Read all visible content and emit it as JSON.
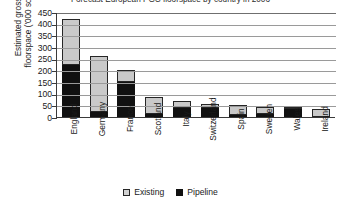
{
  "chart_data": {
    "type": "bar",
    "stacked": true,
    "title": "Forecast European PGC floorspace by country in 2006",
    "xlabel": "",
    "ylabel": "Estimated gross\nfloorspace ('000 sq.m)",
    "ylim": [
      0,
      450
    ],
    "ytick_values": [
      450,
      400,
      350,
      300,
      250,
      200,
      150,
      100,
      50,
      0
    ],
    "ytick_labels": [
      "450",
      "400",
      "350",
      "300",
      "250",
      "200",
      "150",
      "100",
      "50",
      "0"
    ],
    "grid": true,
    "legend_position": "bottom",
    "categories": [
      "England",
      "Germany",
      "France",
      "Scotland",
      "Italy",
      "Switzerland",
      "Spain",
      "Sweden",
      "Wales",
      "Ireland"
    ],
    "series": [
      {
        "name": "Pipeline",
        "color": "#111111",
        "values": [
          225,
          20,
          150,
          15,
          40,
          40,
          10,
          15,
          35,
          0
        ]
      },
      {
        "name": "Existing",
        "color": "#c9c9c9",
        "values": [
          195,
          240,
          50,
          70,
          30,
          15,
          40,
          30,
          10,
          35
        ]
      }
    ],
    "totals": [
      420,
      260,
      200,
      85,
      70,
      55,
      50,
      45,
      45,
      35
    ]
  },
  "legend": {
    "items": [
      {
        "label": "Existing",
        "swatch": "existing-swatch"
      },
      {
        "label": "Pipeline",
        "swatch": "pipeline-swatch"
      }
    ]
  }
}
